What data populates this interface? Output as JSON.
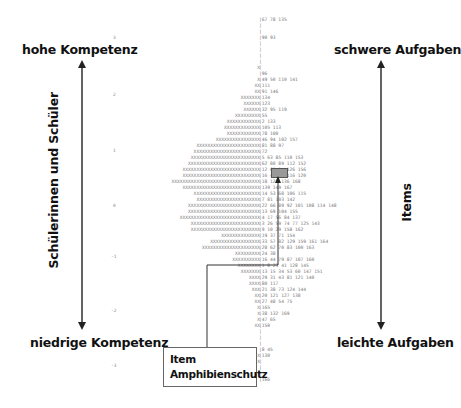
{
  "labels": {
    "top_left": "hohe Kompetenz",
    "bottom_left": "niedrige Kompetenz",
    "top_right": "schwere Aufgaben",
    "bottom_right": "leichte Aufgaben",
    "left_vertical": "Schülerinnen und Schüler",
    "right_vertical": "Items",
    "callout_line1": "Item",
    "callout_line2": "Amphibienschutz"
  },
  "axis_ticks": [
    "3",
    "2",
    "1",
    "0",
    "-1",
    "-2",
    "-3"
  ],
  "highlighted_item": "62",
  "rows": [
    {
      "persons": "",
      "items": "|67 78 135"
    },
    {
      "persons": "",
      "items": "|"
    },
    {
      "persons": "",
      "items": "|"
    },
    {
      "persons": "",
      "items": "|90 93"
    },
    {
      "persons": "",
      "items": "|"
    },
    {
      "persons": "",
      "items": "|"
    },
    {
      "persons": "",
      "items": "|"
    },
    {
      "persons": "",
      "items": "|"
    },
    {
      "persons": "X",
      "items": "|"
    },
    {
      "persons": "",
      "items": "|96"
    },
    {
      "persons": "X",
      "items": "|49 50 110 141"
    },
    {
      "persons": "XX",
      "items": "|111"
    },
    {
      "persons": "XX",
      "items": "|91 146"
    },
    {
      "persons": "XXXXXXX",
      "items": "|134"
    },
    {
      "persons": "XXXXXX",
      "items": "|123"
    },
    {
      "persons": "XXXXXX",
      "items": "|32 95 119"
    },
    {
      "persons": "XXXXXXXXX",
      "items": "|55"
    },
    {
      "persons": "XXXXXXXXXXXX",
      "items": "|2 133"
    },
    {
      "persons": "XXXXXXXXXXXXX",
      "items": "|105 113"
    },
    {
      "persons": "XXXXXXXXXXXX",
      "items": "|78 100"
    },
    {
      "persons": "XXXXXXXXXXXXXXXX",
      "items": "|46 94 102 157"
    },
    {
      "persons": "XXXXXXXXXXXXXXXXXXXXXXX",
      "items": "|81 88 97"
    },
    {
      "persons": "XXXXXXXXXXXXXXXXXXXXXXXX",
      "items": "|72"
    },
    {
      "persons": "XXXXXXXXXXXXXXXXXXXXXXXXX",
      "items": "|5 63 85 110 153"
    },
    {
      "persons": "XXXXXXXXXXXXXXXXXXXXXXXXXX",
      "items": "|62 80 89 112 152"
    },
    {
      "persons": "XXXXXXXXXXXXXXXXXXXXXXXXXXXX",
      "items": "|12 60 94 126 156"
    },
    {
      "persons": "XXXXXXXXXXXXXXXXXXXXXXXXXXXX",
      "items": "|16 40 58 116 120"
    },
    {
      "persons": "XXXXXXXXXXXXXXXXXXXXXXXXXXXXXXXX",
      "items": "|18 122 136 168"
    },
    {
      "persons": "XXXXXXXXXXXXXXXXXXXXXXXXXXXX",
      "items": "|139 149 167"
    },
    {
      "persons": "XXXXXXXXXXXXXXXXXXXXXXXX",
      "items": "|14 53 68 106 115"
    },
    {
      "persons": "XXXXXXXXXXXXXXXXXXXXXXX",
      "items": "|7 81 103 142"
    },
    {
      "persons": "XXXXXXXXXXXXXXXXXXXXXXXXXX",
      "items": "|22 66 89 92 101 108 114 148"
    },
    {
      "persons": "XXXXXXXXXXXXXXXXXXXXXXXXXX",
      "items": "|13 69 104 155"
    },
    {
      "persons": "XXXXXXXXXXXXXXXXXXXXXXXXXXXXX",
      "items": "|4 17 56 84 137"
    },
    {
      "persons": "XXXXXXXXXXXXXXXXXXXXXXXXX",
      "items": "|3 26 59 74 77 125 143"
    },
    {
      "persons": "XXXXXXXXXXXXXXXXXXXXXXXXX",
      "items": "|9 10 29 158 162"
    },
    {
      "persons": "XXXXXXXXXXXXXX",
      "items": "|19 37 71 154"
    },
    {
      "persons": "XXXXXXXXXXXXXXXXXX",
      "items": "|33 57 82 129 159 161 164"
    },
    {
      "persons": "XXXXXXXXXXXXXXXXXXXXX",
      "items": "|28 62 70 83 100 163"
    },
    {
      "persons": "XXXXXXXXX",
      "items": "|24 38"
    },
    {
      "persons": "XXXXXXXXXX",
      "items": "|16 44 79 87 107 160"
    },
    {
      "persons": "XXXXXXXX",
      "items": "|1 8 23 41 128 145"
    },
    {
      "persons": "XXXXXXX",
      "items": "|13 15 34 53 60 147 151"
    },
    {
      "persons": "XXXX",
      "items": "|29 31 43 81 121 140"
    },
    {
      "persons": "XXXX",
      "items": "|80 117"
    },
    {
      "persons": "XXX",
      "items": "|21 38 73 124 144"
    },
    {
      "persons": "XX",
      "items": "|20 121 127 138"
    },
    {
      "persons": "XX",
      "items": "|27 48 54 75"
    },
    {
      "persons": "X",
      "items": "|165"
    },
    {
      "persons": "X",
      "items": "|38 132 169"
    },
    {
      "persons": "X",
      "items": "|47 65"
    },
    {
      "persons": "XX",
      "items": "|150"
    },
    {
      "persons": "",
      "items": "|"
    },
    {
      "persons": "",
      "items": "|"
    },
    {
      "persons": "",
      "items": "|"
    },
    {
      "persons": "",
      "items": "|8 45"
    },
    {
      "persons": "X",
      "items": "|130"
    },
    {
      "persons": "X",
      "items": "|"
    },
    {
      "persons": "",
      "items": "|"
    },
    {
      "persons": "",
      "items": "|"
    },
    {
      "persons": "",
      "items": "|166"
    }
  ]
}
